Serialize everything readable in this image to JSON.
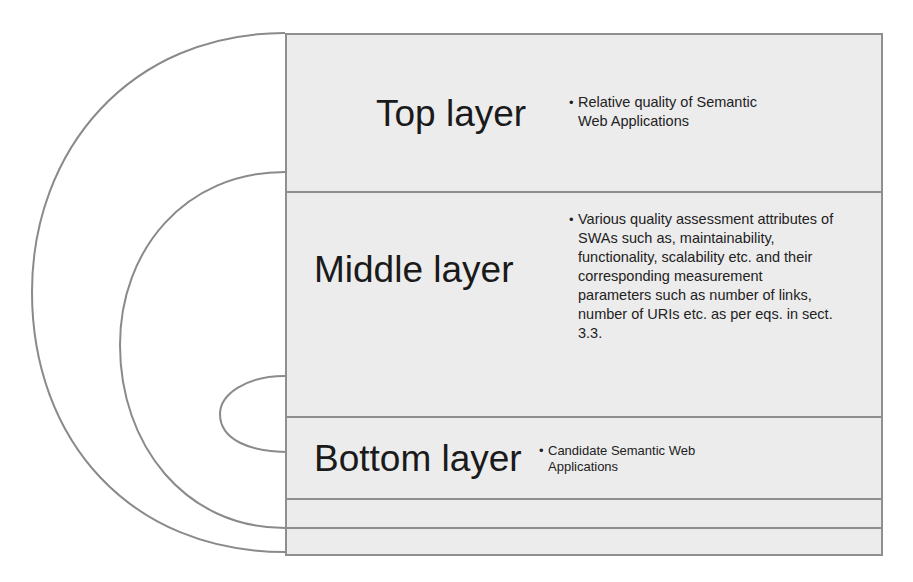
{
  "diagram": {
    "layers": [
      {
        "id": "top",
        "title": "Top layer",
        "description": "Relative quality of Semantic Web Applications"
      },
      {
        "id": "middle",
        "title": "Middle layer",
        "description": "Various quality assessment attributes of SWAs such as, maintainability, functionality, scalability etc. and their corresponding measurement parameters such as number of links, number of URIs etc. as per eqs. in sect. 3.3."
      },
      {
        "id": "bottom",
        "title": "Bottom layer",
        "description": "Candidate Semantic Web Applications"
      }
    ],
    "bullet_glyph": "•",
    "colors": {
      "border": "#8f8f8f",
      "box_fill": "#ececec",
      "arc_stroke": "#8a8a8a",
      "text": "#1a1a1a"
    }
  }
}
